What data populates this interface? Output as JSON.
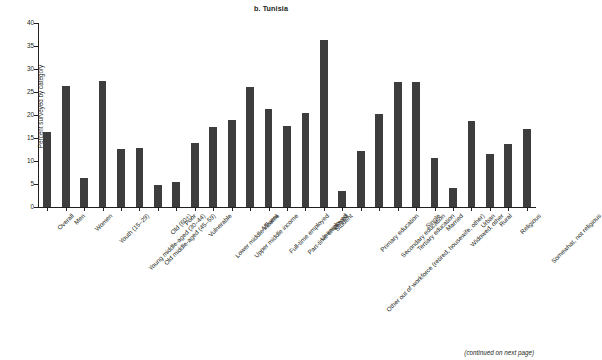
{
  "figure": {
    "title": "b. Tunisia",
    "footnote": "(continued on next page)"
  },
  "chart_data": {
    "type": "bar",
    "title": "b. Tunisia",
    "xlabel": "",
    "ylabel": "Percent surveyed by category",
    "ylim": [
      0,
      40
    ],
    "yticks": [
      0,
      5,
      10,
      15,
      20,
      25,
      30,
      35,
      40
    ],
    "grid": false,
    "legend": null,
    "bar_color": "#3d3d3d",
    "categories": [
      "Overall",
      "Men",
      "Women",
      "Youth (15–29)",
      "Young middle-aged (30–44)",
      "Old middle-aged (45–59)",
      "Old (60+)",
      "Poor",
      "Vulnerable",
      "Lower middle income",
      "Upper middle income",
      "Affluent",
      "Full-time employed",
      "Part-time employed",
      "Unemployed",
      "Student",
      "Other out of workforce (retired, housewife, other)",
      "Primary education",
      "Secondary education",
      "Tertiary education",
      "Single",
      "Married",
      "Widowed, other",
      "Urban",
      "Rural",
      "Religious",
      "Somewhat, not religious"
    ],
    "values": [
      16.2,
      26.3,
      6.4,
      27.3,
      12.6,
      12.8,
      4.8,
      5.4,
      14.0,
      17.4,
      19.0,
      26.0,
      21.4,
      17.6,
      20.4,
      36.3,
      3.4,
      12.2,
      20.2,
      27.1,
      27.1,
      10.6,
      4.2,
      18.6,
      11.5,
      13.6,
      16.9
    ]
  }
}
